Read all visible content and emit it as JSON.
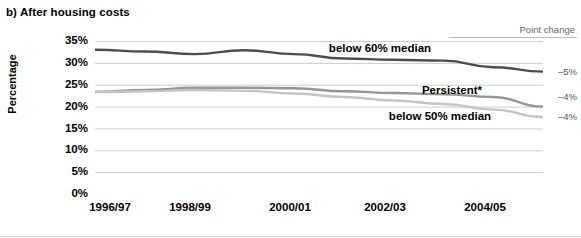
{
  "chart_data": {
    "type": "line",
    "title": "b) After housing costs",
    "xlabel": "",
    "ylabel": "Percentage",
    "ylim": [
      0,
      35
    ],
    "y_ticks": [
      "0%",
      "5%",
      "10%",
      "15%",
      "20%",
      "25%",
      "30%",
      "35%"
    ],
    "y_tick_values": [
      0,
      5,
      10,
      15,
      20,
      25,
      30,
      35
    ],
    "x": [
      "1996/97",
      "1997/98",
      "1998/99",
      "1999/00",
      "2000/01",
      "2001/02",
      "2002/03",
      "2003/04",
      "2004/05",
      "2005/06"
    ],
    "x_tick_labels": [
      "1996/97",
      "1998/99",
      "2000/01",
      "2002/03",
      "2004/05"
    ],
    "x_tick_indices": [
      0,
      2,
      4,
      6,
      8
    ],
    "grid": "horizontal",
    "legend_position": "inline",
    "series": [
      {
        "name": "below 60% median",
        "color": "#4d4d4d",
        "values": [
          33.0,
          32.6,
          32.0,
          32.9,
          32.0,
          31.0,
          30.7,
          30.5,
          29.0,
          28.0
        ],
        "point_change": "–5%"
      },
      {
        "name": "Persistent*",
        "color": "#969696",
        "values": [
          23.4,
          23.8,
          24.3,
          24.3,
          24.2,
          23.5,
          23.1,
          22.8,
          22.2,
          20.0
        ],
        "point_change": "–4%"
      },
      {
        "name": "below 50% median",
        "color": "#c4c4c4",
        "values": [
          23.3,
          23.5,
          23.8,
          23.6,
          23.0,
          22.2,
          21.4,
          20.6,
          19.3,
          17.6
        ],
        "point_change": "–4%"
      }
    ],
    "annotations": {
      "point_change_header": "Point change",
      "series_labels": [
        "below 60% median",
        "Persistent*",
        "below 50% median"
      ]
    },
    "colors": {
      "grid": "#cccccc",
      "text": "#000000",
      "muted_text": "#666666",
      "background": "#ffffff"
    }
  }
}
